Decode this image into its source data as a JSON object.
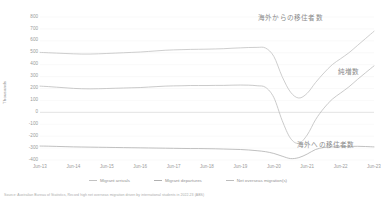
{
  "chart_data": {
    "type": "line",
    "title": "",
    "xlabel": "",
    "ylabel": "Thousands",
    "ylim": [
      -400,
      800
    ],
    "grid": true,
    "legend_position": "bottom",
    "categories": [
      "Jun-13",
      "Jun-14",
      "Jun-15",
      "Jun-16",
      "Jun-17",
      "Jun-18",
      "Jun-19",
      "Jun-20",
      "Jun-21",
      "Jun-22",
      "Jun-23"
    ],
    "ytick_labels": [
      "800",
      "700",
      "600",
      "500",
      "400",
      "300",
      "200",
      "100",
      "0",
      "-100",
      "-200",
      "-300",
      "-400"
    ],
    "ytick_values": [
      800,
      700,
      600,
      500,
      400,
      300,
      200,
      100,
      0,
      -100,
      -200,
      -300,
      -400
    ],
    "series": [
      {
        "name": "Migrant arrivals",
        "color": "#c2c2c2",
        "x": [
          "Jun-13",
          "Sep-13",
          "Dec-13",
          "Mar-14",
          "Jun-14",
          "Sep-14",
          "Dec-14",
          "Mar-15",
          "Jun-15",
          "Sep-15",
          "Dec-15",
          "Mar-16",
          "Jun-16",
          "Sep-16",
          "Dec-16",
          "Mar-17",
          "Jun-17",
          "Sep-17",
          "Dec-17",
          "Mar-18",
          "Jun-18",
          "Sep-18",
          "Dec-18",
          "Mar-19",
          "Jun-19",
          "Sep-19",
          "Dec-19",
          "Mar-20",
          "Jun-20",
          "Sep-20",
          "Dec-20",
          "Mar-21",
          "Jun-21",
          "Sep-21",
          "Dec-21",
          "Mar-22",
          "Jun-22",
          "Sep-22",
          "Dec-22",
          "Mar-23",
          "Jun-23"
        ],
        "values": [
          503,
          500,
          497,
          494,
          491,
          489,
          489,
          491,
          494,
          497,
          500,
          503,
          506,
          511,
          516,
          521,
          524,
          526,
          528,
          529,
          530,
          532,
          534,
          538,
          541,
          544,
          545,
          540,
          470,
          300,
          170,
          120,
          160,
          250,
          330,
          400,
          450,
          500,
          560,
          620,
          680
        ]
      },
      {
        "name": "Migrant departures",
        "color": "#b0b0b0",
        "x": [
          "Jun-13",
          "Sep-13",
          "Dec-13",
          "Mar-14",
          "Jun-14",
          "Sep-14",
          "Dec-14",
          "Mar-15",
          "Jun-15",
          "Sep-15",
          "Dec-15",
          "Mar-16",
          "Jun-16",
          "Sep-16",
          "Dec-16",
          "Mar-17",
          "Jun-17",
          "Sep-17",
          "Dec-17",
          "Mar-18",
          "Jun-18",
          "Sep-18",
          "Dec-18",
          "Mar-19",
          "Jun-19",
          "Sep-19",
          "Dec-19",
          "Mar-20",
          "Jun-20",
          "Sep-20",
          "Dec-20",
          "Mar-21",
          "Jun-21",
          "Sep-21",
          "Dec-21",
          "Mar-22",
          "Jun-22",
          "Sep-22",
          "Dec-22",
          "Mar-23",
          "Jun-23"
        ],
        "values": [
          -283,
          -284,
          -286,
          -288,
          -290,
          -291,
          -292,
          -293,
          -294,
          -295,
          -296,
          -297,
          -298,
          -299,
          -300,
          -301,
          -302,
          -303,
          -304,
          -304,
          -305,
          -306,
          -308,
          -310,
          -312,
          -316,
          -322,
          -330,
          -345,
          -368,
          -388,
          -380,
          -350,
          -312,
          -295,
          -290,
          -288,
          -286,
          -285,
          -287,
          -290
        ]
      },
      {
        "name": "Net overseas migration(s)",
        "color": "#bdbdbd",
        "x": [
          "Jun-13",
          "Sep-13",
          "Dec-13",
          "Mar-14",
          "Jun-14",
          "Sep-14",
          "Dec-14",
          "Mar-15",
          "Jun-15",
          "Sep-15",
          "Dec-15",
          "Mar-16",
          "Jun-16",
          "Sep-16",
          "Dec-16",
          "Mar-17",
          "Jun-17",
          "Sep-17",
          "Dec-17",
          "Mar-18",
          "Jun-18",
          "Sep-18",
          "Dec-18",
          "Mar-19",
          "Jun-19",
          "Sep-19",
          "Dec-19",
          "Mar-20",
          "Jun-20",
          "Sep-20",
          "Dec-20",
          "Mar-21",
          "Jun-21",
          "Sep-21",
          "Dec-21",
          "Mar-22",
          "Jun-22",
          "Sep-22",
          "Dec-22",
          "Mar-23",
          "Jun-23"
        ],
        "values": [
          220,
          216,
          211,
          206,
          201,
          198,
          197,
          198,
          200,
          202,
          204,
          206,
          208,
          212,
          216,
          220,
          222,
          223,
          225,
          225,
          225,
          226,
          226,
          228,
          229,
          228,
          223,
          210,
          125,
          -68,
          -218,
          -260,
          -190,
          -62,
          35,
          110,
          162,
          214,
          275,
          333,
          390
        ]
      }
    ],
    "annotations": [
      {
        "id": "arrivals",
        "text": "海外からの移住者数"
      },
      {
        "id": "net",
        "text": "純増数"
      },
      {
        "id": "departures",
        "text": "海外への移住者数"
      }
    ]
  },
  "source": {
    "text": "Source: Australian Bureau of Statistics, Record high net overseas migration driven by international students in 2022-23 (ABS)"
  }
}
